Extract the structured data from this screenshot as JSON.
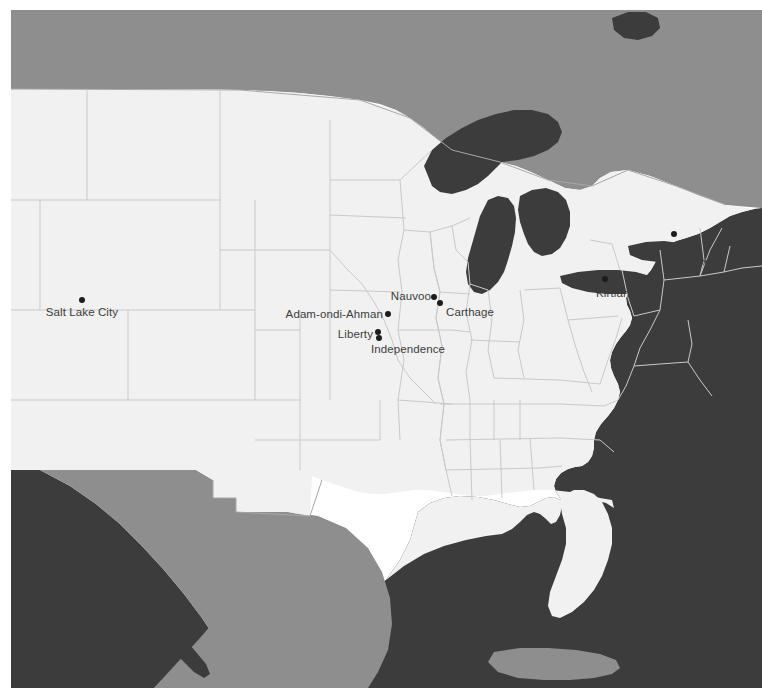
{
  "map": {
    "title": "Map of historic Latter Day Saint sites in the United States",
    "projection_note": "Conic projection of the central and eastern United States",
    "colors": {
      "background": "#ffffff",
      "united_states_land": "#f1f1f1",
      "foreign_land": "#8e8e8e",
      "water": "#3c3c3c",
      "state_border": "#c9c9c9",
      "country_border": "#a8a8a8",
      "marker_fill": "#1c1c1c",
      "label_text": "#3c3c3c"
    },
    "legend_present": false,
    "scalebar_present": false,
    "compass_present": false
  },
  "sites": [
    {
      "name": "Salt Lake City",
      "dot_x": 82,
      "dot_y": 300,
      "label_x": 82,
      "label_y": 312,
      "anchor": "center"
    },
    {
      "name": "Adam-ondi-Ahman",
      "dot_x": 388,
      "dot_y": 314,
      "label_x": 383,
      "label_y": 314,
      "anchor": "right"
    },
    {
      "name": "Liberty",
      "dot_x": 378,
      "dot_y": 332,
      "label_x": 373,
      "label_y": 334,
      "anchor": "right"
    },
    {
      "name": "Independence",
      "dot_x": 379,
      "dot_y": 338,
      "label_x": 374,
      "label_y": 349,
      "anchor": "center-offset"
    },
    {
      "name": "Nauvoo",
      "dot_x": 434,
      "dot_y": 297,
      "label_x": 430,
      "label_y": 296,
      "anchor": "right"
    },
    {
      "name": "Carthage",
      "dot_x": 440,
      "dot_y": 303,
      "label_x": 446,
      "label_y": 312,
      "anchor": "left"
    },
    {
      "name": "Kirtland",
      "dot_x": 605,
      "dot_y": 279,
      "label_x": 616,
      "label_y": 293,
      "anchor": "center"
    },
    {
      "name": "Palmyra",
      "dot_x": 674,
      "dot_y": 234,
      "label_x": 693,
      "label_y": 262,
      "anchor": "center"
    }
  ],
  "regions": [
    {
      "name": "Canada",
      "fill": "foreign_land"
    },
    {
      "name": "Mexico",
      "fill": "foreign_land"
    },
    {
      "name": "Cuba",
      "fill": "foreign_land"
    },
    {
      "name": "United States",
      "fill": "united_states_land"
    },
    {
      "name": "Atlantic Ocean",
      "fill": "water"
    },
    {
      "name": "Gulf of Mexico",
      "fill": "water"
    },
    {
      "name": "Pacific Ocean",
      "fill": "water"
    },
    {
      "name": "Great Lakes",
      "fill": "water"
    }
  ]
}
